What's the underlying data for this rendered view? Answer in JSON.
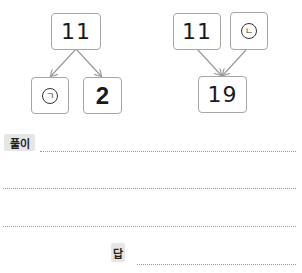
{
  "diagram_left": {
    "top": "11",
    "bottom_left": "ㄱ",
    "bottom_right": "2"
  },
  "diagram_right": {
    "top_left": "11",
    "top_right": "ㄴ",
    "bottom": "19"
  },
  "solution": {
    "label": "풀이"
  },
  "answer": {
    "label": "답"
  },
  "colors": {
    "box_border": "#a6a6a6",
    "arrow": "#9a9a9a",
    "label_bg": "#e6e6e6",
    "dotted_line": "#9a9a9a"
  }
}
